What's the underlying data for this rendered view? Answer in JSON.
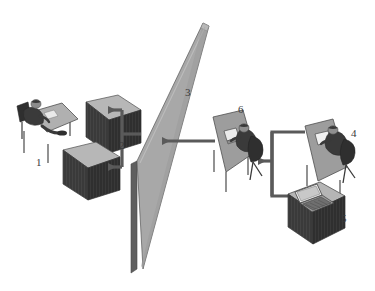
{
  "figure": {
    "type": "isometric-architecture-diagram",
    "background_color": "#ffffff",
    "title": "",
    "label_color": "#3a3a3a"
  },
  "palette": {
    "surface_light": "#b9b9b9",
    "surface_mid": "#a5a5a5",
    "surface_dark": "#8c8c8c",
    "box_top": "#b5b5b5",
    "box_front_dark": "#3c3c3c",
    "box_side_dark": "#2e2e2e",
    "wall_face": "#a8a8a8",
    "wall_edge": "#d8d8d8",
    "wall_side": "#6e6e6e",
    "arrow": "#5a5a5a",
    "person_dark": "#3a3a3a",
    "chair": "#2f2f2f",
    "outline": "#4a4a4a",
    "screen": "#efefef"
  },
  "labels": [
    {
      "id": "1",
      "text": "1",
      "x": 36,
      "y": 157,
      "describes": "seated-worker-desk-left"
    },
    {
      "id": "2",
      "text": "2",
      "x": 119,
      "y": 140,
      "describes": "double-arrow-from-wall-to-servers"
    },
    {
      "id": "3",
      "text": "3",
      "x": 185,
      "y": 87,
      "describes": "wall-barrier-panel"
    },
    {
      "id": "4",
      "text": "4",
      "x": 351,
      "y": 128,
      "describes": "seated-worker-desk-right"
    },
    {
      "id": "5",
      "text": "5",
      "x": 341,
      "y": 213,
      "describes": "laptop-on-server-box"
    },
    {
      "id": "6",
      "text": "6",
      "x": 238,
      "y": 104,
      "describes": "seated-worker-desk-middle"
    }
  ],
  "nodes": [
    {
      "name": "worker-desk-left",
      "label": "1",
      "role": "user workstation left of barrier"
    },
    {
      "name": "server-box-upper",
      "label": "2",
      "role": "server block upper"
    },
    {
      "name": "server-box-lower",
      "label": "2",
      "role": "server block lower"
    },
    {
      "name": "barrier-wall",
      "label": "3",
      "role": "central separating wall panel"
    },
    {
      "name": "worker-desk-right",
      "label": "4",
      "role": "user workstation far right"
    },
    {
      "name": "laptop-on-box",
      "label": "5",
      "role": "laptop resting on server box"
    },
    {
      "name": "worker-desk-middle",
      "label": "6",
      "role": "user workstation right of barrier"
    }
  ],
  "connections": [
    {
      "name": "wall-to-servers-branch",
      "from": "barrier-wall",
      "to": [
        "server-box-upper",
        "server-box-lower"
      ],
      "style": "bracket-double-arrow",
      "direction": "left",
      "label": "2"
    },
    {
      "name": "desk6-to-wall",
      "from": "worker-desk-middle",
      "to": "barrier-wall",
      "style": "straight-arrow",
      "direction": "left"
    },
    {
      "name": "right-group-to-desk6",
      "from": [
        "worker-desk-right",
        "laptop-on-box"
      ],
      "to": "worker-desk-middle",
      "style": "bracket-arrow",
      "direction": "left"
    }
  ]
}
